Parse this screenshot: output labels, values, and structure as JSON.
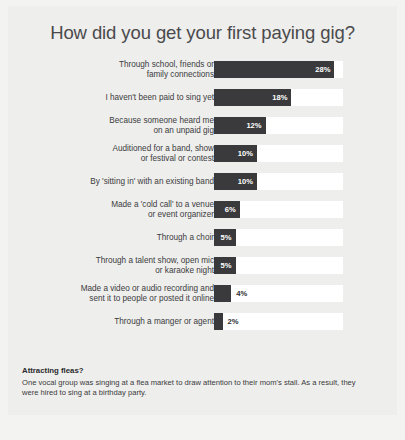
{
  "chart_data": {
    "type": "bar",
    "title": "How did you get your first paying gig?",
    "xlabel": "",
    "ylabel": "",
    "orientation": "horizontal",
    "grid": false,
    "legend": "none",
    "xlim": [
      0,
      30
    ],
    "value_suffix": "%",
    "track_max": 30,
    "categories": [
      "Through school, friends or family connections",
      "I haven't been paid to sing yet",
      "Because someone heard me on an unpaid gig",
      "Auditioned for a band, show or festival or contest",
      "By 'sitting in' with an existing band",
      "Made a 'cold call' to a venue or event organizer",
      "Through a choir",
      "Through a talent show, open mic or karaoke night",
      "Made a video or audio recording and sent it to people or posted it online",
      "Through a manger or agent"
    ],
    "values": [
      28,
      18,
      12,
      10,
      10,
      6,
      5,
      5,
      4,
      2
    ],
    "value_labels": [
      "28%",
      "18%",
      "12%",
      "10%",
      "10%",
      "6%",
      "5%",
      "5%",
      "4%",
      "2%"
    ],
    "rows": [
      {
        "label_line1": "Through school, friends or",
        "label_line2": "family connections",
        "value": 28,
        "value_label": "28%",
        "label_position": "inside"
      },
      {
        "label_line1": "I haven't been paid to sing yet",
        "label_line2": "",
        "value": 18,
        "value_label": "18%",
        "label_position": "inside"
      },
      {
        "label_line1": "Because someone heard me",
        "label_line2": "on an unpaid gig",
        "value": 12,
        "value_label": "12%",
        "label_position": "inside"
      },
      {
        "label_line1": "Auditioned for a band, show",
        "label_line2": "or festival or contest",
        "value": 10,
        "value_label": "10%",
        "label_position": "inside"
      },
      {
        "label_line1": "By 'sitting in' with an existing band",
        "label_line2": "",
        "value": 10,
        "value_label": "10%",
        "label_position": "inside"
      },
      {
        "label_line1": "Made a 'cold call' to a venue",
        "label_line2": "or event organizer",
        "value": 6,
        "value_label": "6%",
        "label_position": "inside"
      },
      {
        "label_line1": "Through a choir",
        "label_line2": "",
        "value": 5,
        "value_label": "5%",
        "label_position": "inside"
      },
      {
        "label_line1": "Through a talent show, open mic",
        "label_line2": "or karaoke night",
        "value": 5,
        "value_label": "5%",
        "label_position": "inside"
      },
      {
        "label_line1": "Made a video or audio recording and",
        "label_line2": "sent it to people or posted it online",
        "value": 4,
        "value_label": "4%",
        "label_position": "outside"
      },
      {
        "label_line1": "Through a manger or agent",
        "label_line2": "",
        "value": 2,
        "value_label": "2%",
        "label_position": "outside"
      }
    ]
  },
  "footnote": {
    "heading": "Attracting fleas?",
    "body": "One vocal group was singing at a flea market to draw attention to their mom's stall. As a result, they were hired to sing at a birthday party."
  },
  "colors": {
    "bar": "#3a3a3c",
    "track": "#ffffff",
    "card_background": "#eeeeec",
    "page_background": "#f3f3f2",
    "title_text": "#4a4a4c",
    "label_text": "#3c3c3e",
    "value_text_inside": "#ffffff",
    "value_text_outside": "#2f2f31"
  }
}
